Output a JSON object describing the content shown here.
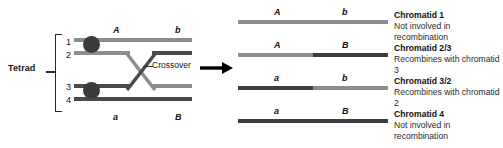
{
  "diagram": {
    "title_left": "Tetrad",
    "crossover_label": "Crossover",
    "arrow": "arrow-right-icon",
    "strand_numbers": [
      "1",
      "2",
      "3",
      "4"
    ],
    "left_alleles": {
      "top_left": "A",
      "top_right": "b",
      "bottom_left": "a",
      "bottom_right": "B"
    },
    "colors": {
      "light_strand": "#8d8d8d",
      "dark_strand": "#4a4a4a",
      "centromere": "#3b3b3b",
      "text": "#141414",
      "arrow": "#000000"
    }
  },
  "chromatids": [
    {
      "allele_left": "A",
      "allele_right": "b",
      "name": "Chromatid 1",
      "note": "Not involved in recombination",
      "segments": [
        {
          "color": "#8d8d8d",
          "width": 100
        }
      ]
    },
    {
      "allele_left": "A",
      "allele_right": "B",
      "name": "Chromatid 2/3",
      "note": "Recombines with chromatid 3",
      "segments": [
        {
          "color": "#8d8d8d",
          "width": 50
        },
        {
          "color": "#3d3d3d",
          "width": 50
        }
      ]
    },
    {
      "allele_left": "a",
      "allele_right": "b",
      "name": "Chromatid 3/2",
      "note": "Recombines with chromatid 2",
      "segments": [
        {
          "color": "#3d3d3d",
          "width": 50
        },
        {
          "color": "#8d8d8d",
          "width": 50
        }
      ]
    },
    {
      "allele_left": "a",
      "allele_right": "B",
      "name": "Chromatid 4",
      "note": "Not involved in recombination",
      "segments": [
        {
          "color": "#3d3d3d",
          "width": 100
        }
      ]
    }
  ]
}
